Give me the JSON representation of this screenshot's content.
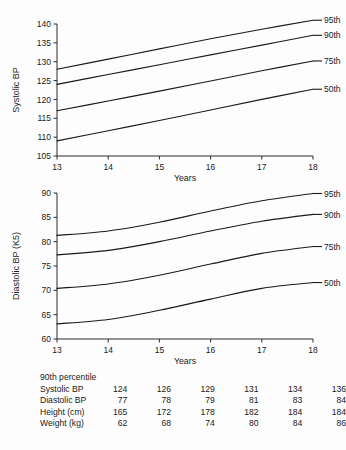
{
  "chart_data": [
    {
      "type": "line",
      "id": "systolic",
      "title": "",
      "xlabel": "Years",
      "ylabel": "Systolic BP",
      "x": [
        13,
        14,
        15,
        16,
        17,
        18
      ],
      "xlim": [
        13,
        18
      ],
      "ylim": [
        105,
        140
      ],
      "xticks": [
        13,
        14,
        15,
        16,
        17,
        18
      ],
      "yticks": [
        105,
        110,
        115,
        120,
        125,
        130,
        135,
        140
      ],
      "grid": false,
      "legend_position": "right-of-line-ends",
      "series": [
        {
          "name": "95th",
          "values": [
            128.0,
            130.7,
            133.4,
            136.1,
            138.6,
            141.0
          ]
        },
        {
          "name": "90th",
          "values": [
            124.0,
            126.6,
            129.2,
            131.8,
            134.4,
            137.0
          ]
        },
        {
          "name": "75th",
          "values": [
            117.0,
            119.6,
            122.2,
            124.9,
            127.6,
            130.2
          ]
        },
        {
          "name": "50th",
          "values": [
            109.0,
            111.7,
            114.4,
            117.2,
            120.0,
            122.7
          ]
        }
      ]
    },
    {
      "type": "line",
      "id": "diastolic",
      "title": "",
      "xlabel": "Years",
      "ylabel": "Diastolic BP (K5)",
      "x": [
        13,
        14,
        15,
        16,
        17,
        18
      ],
      "xlim": [
        13,
        18
      ],
      "ylim": [
        60,
        90
      ],
      "xticks": [
        13,
        14,
        15,
        16,
        17,
        18
      ],
      "yticks": [
        60,
        65,
        70,
        75,
        80,
        85,
        90
      ],
      "grid": false,
      "legend_position": "right-of-line-ends",
      "series": [
        {
          "name": "95th",
          "values": [
            81.3,
            82.2,
            84.0,
            86.3,
            88.4,
            89.9
          ]
        },
        {
          "name": "90th",
          "values": [
            77.3,
            78.2,
            80.0,
            82.2,
            84.2,
            85.6
          ]
        },
        {
          "name": "75th",
          "values": [
            70.4,
            71.3,
            73.1,
            75.4,
            77.6,
            79.0
          ]
        },
        {
          "name": "50th",
          "values": [
            63.1,
            64.0,
            65.9,
            68.2,
            70.4,
            71.6
          ]
        }
      ]
    }
  ],
  "table": {
    "caption": "90th percentile",
    "columns": [
      "13",
      "14",
      "15",
      "16",
      "17",
      "18"
    ],
    "rows": [
      {
        "label": "Systolic BP",
        "values": [
          "124",
          "126",
          "129",
          "131",
          "134",
          "136"
        ]
      },
      {
        "label": "Diastolic BP",
        "values": [
          "77",
          "78",
          "79",
          "81",
          "83",
          "84"
        ]
      },
      {
        "label": "Height (cm)",
        "values": [
          "165",
          "172",
          "178",
          "182",
          "184",
          "184"
        ]
      },
      {
        "label": "Weight (kg)",
        "values": [
          "62",
          "68",
          "74",
          "80",
          "84",
          "86"
        ]
      }
    ]
  }
}
